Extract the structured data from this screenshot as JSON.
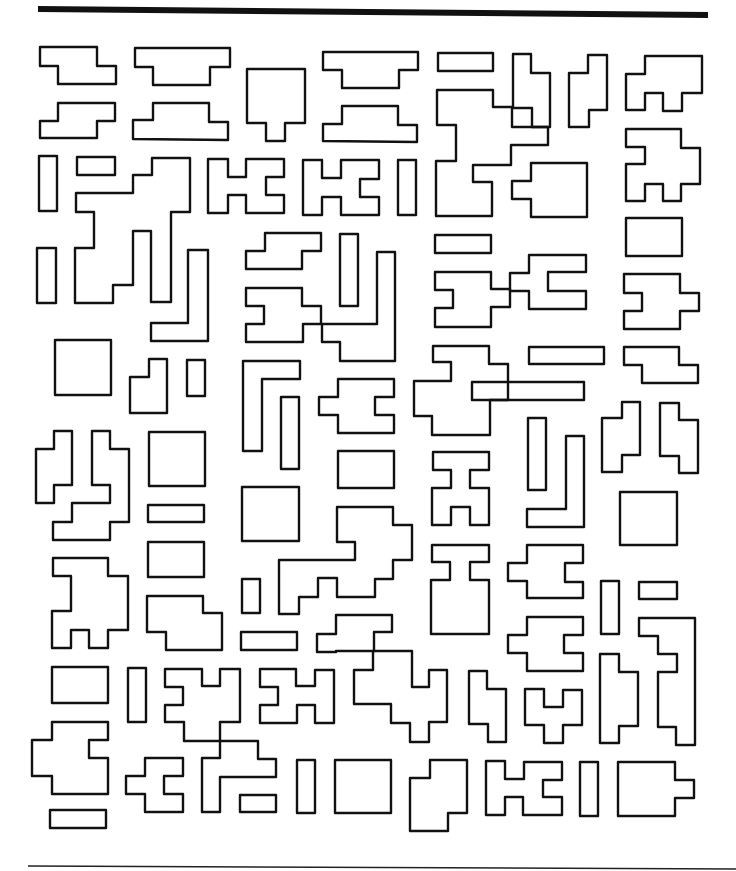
{
  "figure": {
    "stroke_color": "#111111",
    "background": "#ffffff",
    "top_rule": {
      "x1": 38,
      "y1": 9,
      "x2": 708,
      "y2": 15
    },
    "bottom_rule": {
      "x1": 28,
      "y1": 866,
      "x2": 736,
      "y2": 869
    }
  },
  "shapes": [
    {
      "id": "s1",
      "points": "40,47 97,47 97,66 116,66 116,84 58,84 58,66 40,66"
    },
    {
      "id": "s2",
      "points": "40,138 40,121 58,121 58,103 115,103 115,121 97,121 97,138"
    },
    {
      "id": "s3",
      "points": "135,48 230,48 230,67 210,67 210,85 153,85 153,67 135,67"
    },
    {
      "id": "s4",
      "points": "133,139 133,120 153,120 153,103 209,103 209,122 228,122 228,140"
    },
    {
      "id": "s5",
      "points": "247,69 305,69 305,123 285,123 285,141 266,141 266,123 247,123"
    },
    {
      "id": "s6",
      "points": "323,52 418,52 418,70 399,70 399,88 342,88 342,70 323,70"
    },
    {
      "id": "s7",
      "points": "323,141 323,124 342,124 342,106 398,106 398,125 417,125 417,142"
    },
    {
      "id": "s8",
      "points": "438,53 493,53 493,71 438,71"
    },
    {
      "id": "s9",
      "points": "437,90 493,90 493,107 512,107 512,127 548,127 548,145 511,145 511,165 473,165 473,182 492,182 492,216 436,216 436,161 456,161 456,125 437,125"
    },
    {
      "id": "s10",
      "points": "513,54 531,54 531,73 550,73 550,127 532,127 532,108 513,108"
    },
    {
      "id": "s11",
      "points": "588,55 607,55 607,110 589,110 589,127 569,127 569,73 588,73"
    },
    {
      "id": "s12",
      "points": "645,56 702,56 702,93 682,93 682,111 663,111 663,93 645,93 645,110 626,110 626,74 645,74"
    },
    {
      "id": "s13",
      "points": "626,129 681,129 681,148 700,148 700,184 681,184 681,201 663,201 663,184 645,184 645,201 626,201 626,164 645,164 645,147 626,147"
    },
    {
      "id": "s14",
      "points": "39,156 57,156 57,211 39,211"
    },
    {
      "id": "s15",
      "points": "77,157 115,157 115,175 77,175"
    },
    {
      "id": "s16",
      "points": "152,158 190,158 190,212 171,212 171,302 151,302 151,231 133,231 133,285 113,285 113,303 75,303 75,248 94,248 94,212 76,212 76,193 133,193 133,175 152,175"
    },
    {
      "id": "s17",
      "points": "208,159 228,159 228,177 246,177 246,159 284,159 284,177 266,177 266,195 284,195 284,213 246,213 246,195 228,195 228,213 208,213"
    },
    {
      "id": "s18",
      "points": "303,160 322,160 322,178 341,178 341,160 379,160 379,179 360,179 360,197 379,197 379,215 341,215 341,197 322,197 322,215 303,215"
    },
    {
      "id": "s19",
      "points": "398,160 416,160 416,215 398,215"
    },
    {
      "id": "s20",
      "points": "531,163 587,163 587,217 531,217 531,199 512,199 512,181 531,181"
    },
    {
      "id": "s21",
      "points": "626,218 682,218 682,256 626,256"
    },
    {
      "id": "s22",
      "points": "37,248 56,248 56,303 37,303"
    },
    {
      "id": "s23",
      "points": "188,250 208,250 208,341 151,341 151,323 188,323"
    },
    {
      "id": "s24",
      "points": "265,233 321,233 321,251 302,251 302,269 246,269 246,251 265,251"
    },
    {
      "id": "s25",
      "points": "340,234 358,234 358,306 340,306"
    },
    {
      "id": "s26",
      "points": "377,252 395,252 395,361 340,361 340,342 322,342 322,324 303,324 303,342 246,342 246,324 264,324 264,306 246,306 246,288 302,288 302,306 321,306 321,324 377,324"
    },
    {
      "id": "s27",
      "points": "435,235 491,235 491,253 435,253"
    },
    {
      "id": "s28",
      "points": "435,272 491,272 491,289 510,289 510,307 491,307 491,327 435,327 435,308 453,308 453,290 435,290"
    },
    {
      "id": "s29",
      "points": "529,255 586,255 586,272 548,272 548,291 586,291 586,309 529,309 529,291 510,291 510,273 529,273"
    },
    {
      "id": "s30",
      "points": "624,274 680,274 680,293 699,293 699,311 680,311 680,329 624,329 624,311 642,311 642,293 624,293"
    },
    {
      "id": "s31",
      "points": "55,340 111,340 111,395 55,395"
    },
    {
      "id": "s32",
      "points": "149,359 167,359 167,413 130,413 130,377 149,377"
    },
    {
      "id": "s33",
      "points": "187,360 205,360 205,396 187,396"
    },
    {
      "id": "s34",
      "points": "243,361 300,361 300,379 262,379 262,451 243,451"
    },
    {
      "id": "s35",
      "points": "281,397 299,397 299,469 281,469"
    },
    {
      "id": "s36",
      "points": "338,379 394,379 394,397 375,397 375,415 394,415 394,433 338,433 338,415 319,415 319,397 338,397"
    },
    {
      "id": "s37",
      "points": "433,346 489,346 489,364 508,364 508,400 490,400 490,435 432,435 432,416 414,416 414,381 451,381 451,362 433,362"
    },
    {
      "id": "s38",
      "points": "529,347 604,347 604,364 529,364"
    },
    {
      "id": "s39",
      "points": "472,382 584,382 584,400 508,400 508,400 472,400"
    },
    {
      "id": "s40",
      "points": "624,347 679,347 679,365 698,365 698,383 642,383 642,365 624,365"
    },
    {
      "id": "s41",
      "points": "54,431 72,431 72,485 54,485 54,503 36,503 36,449 54,449"
    },
    {
      "id": "s42",
      "points": "92,431 110,431 110,449 129,449 129,522 110,522 110,540 53,540 53,522 72,522 72,503 110,503 110,485 92,485"
    },
    {
      "id": "s43",
      "points": "149,432 205,432 205,486 149,486"
    },
    {
      "id": "s44",
      "points": "148,505 204,505 204,522 148,522"
    },
    {
      "id": "s45",
      "points": "338,451 394,451 394,488 338,488"
    },
    {
      "id": "s46",
      "points": "433,452 489,452 489,470 470,470 470,488 489,488 489,525 470,525 470,507 451,507 451,525 432,525 432,488 451,488 451,470 433,470"
    },
    {
      "id": "s47",
      "points": "528,418 546,418 546,490 528,490"
    },
    {
      "id": "s48",
      "points": "566,436 584,436 584,527 527,527 527,509 566,509"
    },
    {
      "id": "s49",
      "points": "622,402 640,402 640,455 622,455 622,472 602,472 602,418 622,418"
    },
    {
      "id": "s50",
      "points": "660,403 679,403 679,420 698,420 698,473 679,473 679,456 660,456"
    },
    {
      "id": "s51",
      "points": "620,492 677,492 677,545 620,545"
    },
    {
      "id": "s52",
      "points": "242,487 299,487 299,541 242,541"
    },
    {
      "id": "s53",
      "points": "337,507 393,507 393,525 412,525 412,560 393,560 393,579 375,579 375,597 337,597 337,578 318,578 318,597 299,597 299,614 279,614 279,560 355,560 355,542 337,542"
    },
    {
      "id": "s54",
      "points": "148,542 204,542 204,577 148,577"
    },
    {
      "id": "s55",
      "points": "53,558 108,558 108,576 128,576 128,630 108,630 108,648 89,648 89,630 71,630 71,648 52,648 52,611 71,611 71,576 53,576"
    },
    {
      "id": "s56",
      "points": "432,545 489,545 489,562 470,562 470,580 489,580 489,634 431,634 431,580 450,580 450,562 432,562"
    },
    {
      "id": "s57",
      "points": "527,545 583,545 583,563 565,563 565,582 583,582 583,598 527,598 527,581 508,581 508,563 527,563"
    },
    {
      "id": "s58",
      "points": "147,596 203,596 203,613 222,613 222,650 166,650 166,632 147,632"
    },
    {
      "id": "s59",
      "points": "242,579 260,579 260,613 242,613"
    },
    {
      "id": "s60",
      "points": "601,581 619,581 619,634 601,634"
    },
    {
      "id": "s61",
      "points": "639,582 677,582 677,599 639,599"
    },
    {
      "id": "s62",
      "points": "241,632 297,632 297,650 241,650"
    },
    {
      "id": "s63",
      "points": "336,615 392,615 392,632 374,632 374,651 336,651 336,652 317,652 317,634 336,634"
    },
    {
      "id": "s64",
      "points": "527,617 583,617 583,635 564,635 564,653 583,653 583,671 527,671 527,653 508,653 508,635 527,635"
    },
    {
      "id": "s65",
      "points": "639,618 695,618 695,745 676,745 676,727 658,727 658,672 677,672 677,654 658,654 658,636 639,636"
    },
    {
      "id": "s66",
      "points": "52,667 108,667 108,703 52,703"
    },
    {
      "id": "s67",
      "points": "128,668 146,668 146,722 128,722"
    },
    {
      "id": "s68",
      "points": "165,669 202,669 202,686 220,686 220,669 240,669 240,722 220,722 220,741 184,741 184,722 165,722 165,705 183,705 183,687 165,687"
    },
    {
      "id": "s69",
      "points": "260,669 296,669 296,686 315,686 315,670 334,670 334,723 315,723 315,705 297,705 297,723 260,723 260,705 278,705 278,687 260,687"
    },
    {
      "id": "s70",
      "points": "373,651 412,651 412,687 429,687 429,670 447,670 447,722 429,722 429,742 410,742 410,723 391,723 391,704 354,704 354,670 373,670"
    },
    {
      "id": "s71",
      "points": "469,671 487,671 487,689 506,689 506,742 488,742 488,724 469,724"
    },
    {
      "id": "s72",
      "points": "525,689 544,689 544,707 563,707 563,690 582,690 582,725 563,725 563,743 544,743 544,725 525,725"
    },
    {
      "id": "s73",
      "points": "600,654 619,654 619,672 638,672 638,726 619,726 619,743 600,743"
    },
    {
      "id": "s74",
      "points": "52,722 108,722 108,740 89,740 89,758 108,758 108,794 52,794 52,776 32,776 32,740 52,740"
    },
    {
      "id": "s75",
      "points": "145,758 183,758 183,776 164,776 164,794 183,794 183,812 145,812 145,794 126,794 126,776 145,776"
    },
    {
      "id": "s76",
      "points": "220,741 258,741 258,759 276,759 276,777 220,777 220,812 202,812 202,758 220,758"
    },
    {
      "id": "s77",
      "points": "240,795 276,795 276,812 240,812"
    },
    {
      "id": "s78",
      "points": "297,760 315,760 315,813 297,813"
    },
    {
      "id": "s79",
      "points": "335,760 391,760 391,813 335,813"
    },
    {
      "id": "s80",
      "points": "430,760 467,760 467,813 448,813 448,831 410,831 410,778 430,778"
    },
    {
      "id": "s81",
      "points": "486,761 505,761 505,779 524,779 524,762 562,762 562,780 543,780 543,797 562,797 562,815 523,815 523,797 505,797 505,815 486,815"
    },
    {
      "id": "s82",
      "points": "580,762 598,762 598,816 580,816"
    },
    {
      "id": "s83",
      "points": "618,762 675,762 675,780 694,780 694,798 675,798 675,816 618,816"
    },
    {
      "id": "s84",
      "points": "50,810 106,810 106,828 50,828"
    }
  ]
}
